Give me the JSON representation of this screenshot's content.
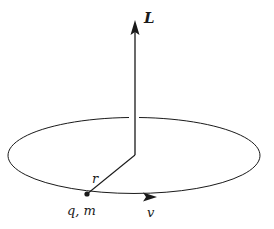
{
  "diagram": {
    "labels": {
      "angular_momentum": "L",
      "radius": "r",
      "particle": "q, m",
      "velocity": "v"
    },
    "colors": {
      "stroke": "#1a1a1a",
      "background": "#ffffff"
    }
  }
}
